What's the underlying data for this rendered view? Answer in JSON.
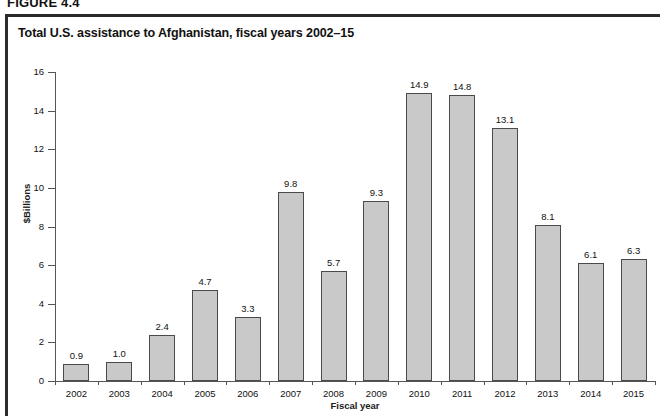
{
  "figure": {
    "number": "FIGURE 4.4",
    "title": "Total U.S. assistance to Afghanistan, fiscal years 2002–15"
  },
  "chart_data": {
    "type": "bar",
    "title": "Total U.S. assistance to Afghanistan, fiscal years 2002–15",
    "xlabel": "Fiscal year",
    "ylabel": "$Billions",
    "ylim": [
      0,
      16
    ],
    "yticks": [
      "0",
      "2",
      "4",
      "6",
      "8",
      "10",
      "12",
      "14",
      "16"
    ],
    "grid": false,
    "legend": null,
    "categories": [
      "2002",
      "2003",
      "2004",
      "2005",
      "2006",
      "2007",
      "2008",
      "2009",
      "2010",
      "2011",
      "2012",
      "2013",
      "2014",
      "2015"
    ],
    "values": [
      0.9,
      1.0,
      2.4,
      4.7,
      3.3,
      9.8,
      5.7,
      9.3,
      14.9,
      14.8,
      13.1,
      8.1,
      6.1,
      6.3
    ],
    "value_labels": [
      "0.9",
      "1.0",
      "2.4",
      "4.7",
      "3.3",
      "9.8",
      "5.7",
      "9.3",
      "14.9",
      "14.8",
      "13.1",
      "8.1",
      "6.1",
      "6.3"
    ],
    "bar_color": "#c9c9c9",
    "bar_edge_color": "#4a4a4a"
  }
}
